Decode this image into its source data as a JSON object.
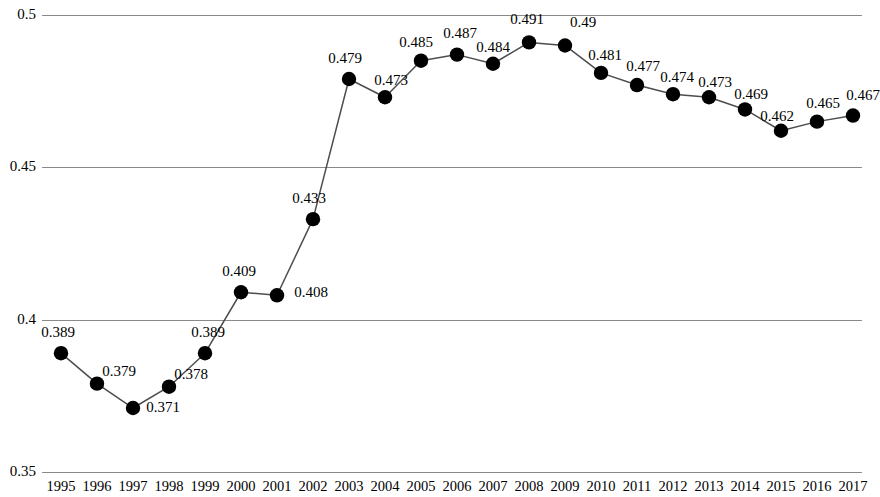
{
  "chart_data": {
    "type": "line",
    "title": "",
    "subtitle": "",
    "xlabel": "",
    "ylabel": "",
    "categories": [
      "1995",
      "1996",
      "1997",
      "1998",
      "1999",
      "2000",
      "2001",
      "2002",
      "2003",
      "2004",
      "2005",
      "2006",
      "2007",
      "2008",
      "2009",
      "2010",
      "2011",
      "2012",
      "2013",
      "2014",
      "2015",
      "2016",
      "2017"
    ],
    "values": [
      0.389,
      0.379,
      0.371,
      0.378,
      0.389,
      0.409,
      0.408,
      0.433,
      0.479,
      0.473,
      0.485,
      0.487,
      0.484,
      0.491,
      0.49,
      0.481,
      0.477,
      0.474,
      0.473,
      0.469,
      0.462,
      0.465,
      0.467
    ],
    "point_labels": [
      "0.389",
      "0.379",
      "0.371",
      "0.378",
      "0.389",
      "0.409",
      "0.408",
      "0.433",
      "0.479",
      "0.473",
      "0.485",
      "0.487",
      "0.484",
      "0.491",
      "0.49",
      "0.481",
      "0.477",
      "0.474",
      "0.473",
      "0.469",
      "0.462",
      "0.465",
      "0.467"
    ],
    "ylim": [
      0.35,
      0.5
    ],
    "yticks": [
      0.5,
      0.45,
      0.4,
      0.35
    ],
    "ytick_labels": [
      "0.5",
      "0.45",
      "0.4",
      "0.35"
    ],
    "grid": true,
    "grid_axis": "y",
    "legend": null,
    "legend_position": "none",
    "series_color": "#000000",
    "line_color": "#4d4d4d",
    "grid_color": "#8a8a8a",
    "marker": "circle",
    "data_labels_shown": true
  }
}
